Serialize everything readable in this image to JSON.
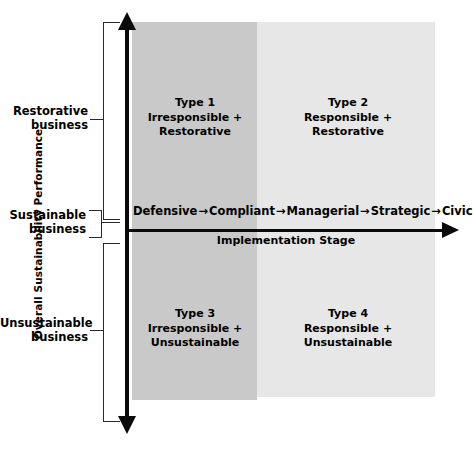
{
  "figure": {
    "type": "2x2-matrix-diagram",
    "y_axis": {
      "title": "Overall Sustainability Performance",
      "categories": [
        {
          "id": "restorative",
          "label": "Restorative\nbusiness",
          "line1": "Restorative",
          "line2": "business"
        },
        {
          "id": "sustainable",
          "label": "Sustainable\nbusiness",
          "line1": "Sustainable",
          "line2": "business"
        },
        {
          "id": "unsustainable",
          "label": "Unsustainable\nbusiness",
          "line1": "Unsustainable",
          "line2": "business"
        }
      ]
    },
    "x_axis": {
      "title": "Implementation Stage",
      "stages": [
        "Defensive",
        "Compliant",
        "Managerial",
        "Strategic",
        "Civic"
      ],
      "separator": "→"
    },
    "quadrants": [
      {
        "id": "type-1",
        "title": "Type 1",
        "line2": "Irresponsible +",
        "line3": "Restorative"
      },
      {
        "id": "type-2",
        "title": "Type 2",
        "line2": "Responsible +",
        "line3": "Restorative"
      },
      {
        "id": "type-3",
        "title": "Type 3",
        "line2": "Irresponsible +",
        "line3": "Unsustainable"
      },
      {
        "id": "type-4",
        "title": "Type 4",
        "line2": "Responsible +",
        "line3": "Unsustainable"
      }
    ],
    "colors": {
      "background": "#ffffff",
      "band_left": "#c9c9c9",
      "band_right": "#e7e7e7",
      "axis": "#0a0a0a",
      "text": "#000000"
    }
  },
  "chart_data": {
    "type": "table",
    "title": "",
    "xlabel": "Implementation Stage",
    "ylabel": "Overall Sustainability Performance",
    "x_categories": [
      "Defensive",
      "Compliant",
      "Managerial",
      "Strategic",
      "Civic"
    ],
    "y_categories": [
      "Restorative business",
      "Sustainable business",
      "Unsustainable business"
    ],
    "cells": [
      {
        "row": "Restorative business",
        "column": "Irresponsible (Defensive–Compliant)",
        "label": "Type 1",
        "detail": "Irresponsible + Restorative"
      },
      {
        "row": "Restorative business",
        "column": "Responsible (Managerial–Civic)",
        "label": "Type 2",
        "detail": "Responsible + Restorative"
      },
      {
        "row": "Unsustainable business",
        "column": "Irresponsible (Defensive–Compliant)",
        "label": "Type 3",
        "detail": "Irresponsible + Unsustainable"
      },
      {
        "row": "Unsustainable business",
        "column": "Responsible (Managerial–Civic)",
        "label": "Type 4",
        "detail": "Responsible + Unsustainable"
      }
    ],
    "grid": false,
    "legend": "none"
  }
}
